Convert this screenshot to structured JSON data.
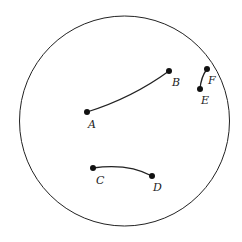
{
  "diagram": {
    "type": "disk-model",
    "colors": {
      "stroke": "#222222",
      "point": "#111111",
      "background": "#ffffff"
    },
    "boundary_circle": {
      "cx": 124.5,
      "cy": 121,
      "r": 105
    },
    "points": [
      {
        "id": "A",
        "label": "A",
        "x": 87,
        "y": 112,
        "label_x": 88,
        "label_y": 128
      },
      {
        "id": "B",
        "label": "B",
        "x": 169,
        "y": 71,
        "label_x": 172,
        "label_y": 86
      },
      {
        "id": "C",
        "label": "C",
        "x": 93,
        "y": 168,
        "label_x": 96,
        "label_y": 184
      },
      {
        "id": "D",
        "label": "D",
        "x": 152,
        "y": 176,
        "label_x": 153,
        "label_y": 191
      },
      {
        "id": "E",
        "label": "E",
        "x": 200,
        "y": 89,
        "label_x": 201,
        "label_y": 104
      },
      {
        "id": "F",
        "label": "F",
        "x": 207,
        "y": 69,
        "label_x": 208,
        "label_y": 84
      }
    ],
    "arcs": [
      {
        "id": "AB",
        "from": "A",
        "to": "B",
        "path": "M87,112 Q132,98 169,71"
      },
      {
        "id": "CD",
        "from": "C",
        "to": "D",
        "path": "M93,168 Q128,163 152,176"
      },
      {
        "id": "EF",
        "from": "E",
        "to": "F",
        "path": "M200,89 Q201,77 207,69"
      }
    ]
  }
}
